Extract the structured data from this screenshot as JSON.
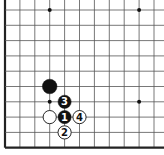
{
  "board": {
    "title": "Go board diagram (lower-left corner)",
    "columns": 11,
    "rows": 10,
    "origin_x": 5,
    "origin_y": 10,
    "spacing_x": 14.9,
    "spacing_y": 15.3,
    "edges": {
      "left": true,
      "bottom": true,
      "top": false,
      "right": false
    },
    "colors": {
      "line": "#555555",
      "edge": "#222222",
      "black": "#111111",
      "white": "#ffffff",
      "star": "#111111"
    },
    "star_points": [
      {
        "col": 3,
        "row": 0
      },
      {
        "col": 9,
        "row": 0
      },
      {
        "col": 3,
        "row": 6
      },
      {
        "col": 9,
        "row": 6
      }
    ],
    "stones": [
      {
        "col": 3,
        "row": 5,
        "color": "black",
        "label": ""
      },
      {
        "col": 3,
        "row": 7,
        "color": "white",
        "label": ""
      },
      {
        "col": 4,
        "row": 7,
        "color": "black",
        "label": "1"
      },
      {
        "col": 4,
        "row": 8,
        "color": "white",
        "label": "2"
      },
      {
        "col": 4,
        "row": 6,
        "color": "black",
        "label": "3"
      },
      {
        "col": 5,
        "row": 7,
        "color": "white",
        "label": "4"
      }
    ]
  }
}
